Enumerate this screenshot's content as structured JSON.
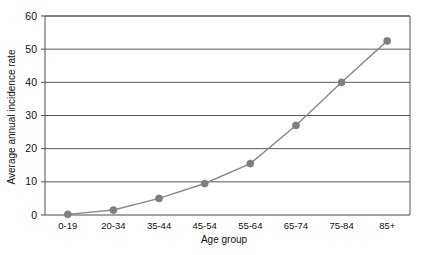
{
  "chart_data": {
    "type": "line",
    "title": "",
    "subtitle": "",
    "xlabel": "Age group",
    "ylabel": "Average annual incidence rate",
    "categories": [
      "0-19",
      "20-34",
      "35-44",
      "45-54",
      "55-64",
      "65-74",
      "75-84",
      "85+"
    ],
    "values": [
      0.2,
      1.5,
      5,
      9.5,
      15.5,
      27,
      40,
      52.5
    ],
    "series": [
      {
        "name": "Average annual incidence rate",
        "values": [
          0.2,
          1.5,
          5,
          9.5,
          15.5,
          27,
          40,
          52.5
        ]
      }
    ],
    "ylim": [
      0,
      60
    ],
    "yticks": [
      0,
      10,
      20,
      30,
      40,
      50,
      60
    ],
    "ytick_labels": [
      "0",
      "10",
      "20",
      "30",
      "40",
      "50",
      "60"
    ],
    "grid": "horizontal",
    "legend": "none",
    "marker": "circle",
    "line_color": "#8a8a8a",
    "marker_color": "#7f7f7f",
    "grid_color": "#595959",
    "axis_color": "#4d4d4d",
    "background": "#ffffff"
  },
  "axes": {
    "y_title": "Average annual incidence rate",
    "x_title": "Age group"
  }
}
